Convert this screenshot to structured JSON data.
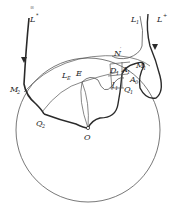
{
  "figure": {
    "type": "topological-diagram",
    "colors": {
      "stroke": "#2a2a2a",
      "thin": "#555555",
      "background": "#ffffff"
    }
  },
  "labels": {
    "L_star_left": {
      "main": "L",
      "sup": "*",
      "pre": "∞"
    },
    "L_star_right": {
      "main": "L",
      "sup": "+"
    },
    "L1": {
      "main": "L",
      "sub": "1"
    },
    "N_prime": {
      "main": "N",
      "sup": "′"
    },
    "M1": {
      "main": "M",
      "sub": "1"
    },
    "M2": {
      "main": "M",
      "sub": "2"
    },
    "D1": {
      "main": "D",
      "sub": "1"
    },
    "A1": {
      "main": "A",
      "sub": "1"
    },
    "A0": {
      "main": "A",
      "sub": "0"
    },
    "Q1": {
      "main": "Q",
      "sub": "1"
    },
    "Q2": {
      "main": "Q",
      "sub": "2"
    },
    "l1": {
      "main": "l",
      "sub": "1"
    },
    "L_E": {
      "main": "L",
      "sub": "E"
    },
    "E": {
      "main": "E"
    },
    "O": {
      "main": "O"
    }
  }
}
